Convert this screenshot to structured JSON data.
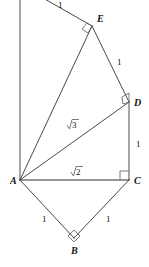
{
  "figure": {
    "background_color": "#ffffff",
    "line_color": "#4a4a4a",
    "label_color": "#111111"
  },
  "vertices": [
    {
      "id": "A",
      "label": "A",
      "x": 20,
      "y": 180,
      "label_x": 10,
      "label_y": 184
    },
    {
      "id": "B",
      "label": "B",
      "x": 74,
      "y": 238,
      "label_x": 71,
      "label_y": 254
    },
    {
      "id": "C",
      "label": "C",
      "x": 129,
      "y": 180,
      "label_x": 134,
      "label_y": 184
    },
    {
      "id": "D",
      "label": "D",
      "x": 129,
      "y": 102,
      "label_x": 134,
      "label_y": 106
    },
    {
      "id": "E",
      "label": "E",
      "x": 92,
      "y": 26,
      "label_x": 97,
      "label_y": 22
    }
  ],
  "segments": [
    {
      "id": "A-B",
      "from": "A",
      "to": "B"
    },
    {
      "id": "B-C",
      "from": "B",
      "to": "C"
    },
    {
      "id": "A-C",
      "from": "A",
      "to": "C"
    },
    {
      "id": "C-D",
      "from": "C",
      "to": "D"
    },
    {
      "id": "A-D",
      "from": "A",
      "to": "D"
    },
    {
      "id": "D-E",
      "from": "D",
      "to": "E"
    },
    {
      "id": "A-E",
      "from": "A",
      "to": "E"
    },
    {
      "id": "E-top",
      "from": "E",
      "to": "top-edge"
    },
    {
      "id": "A-vert",
      "from": "A",
      "to": "top-edge-vertical"
    }
  ],
  "edge_labels": [
    {
      "id": "label-AB",
      "text": "1",
      "x": 42,
      "y": 222,
      "segment": "A-B"
    },
    {
      "id": "label-BC",
      "text": "1",
      "x": 106,
      "y": 222,
      "segment": "B-C"
    },
    {
      "id": "label-CD",
      "text": "1",
      "x": 136,
      "y": 147,
      "segment": "C-D"
    },
    {
      "id": "label-DE",
      "text": "1",
      "x": 117,
      "y": 65,
      "segment": "D-E"
    },
    {
      "id": "label-Etop",
      "text": "1",
      "x": 58,
      "y": 8,
      "segment": "E-top"
    },
    {
      "id": "label-AC",
      "text": "2",
      "x": 76,
      "y": 174,
      "segment": "A-C",
      "radical": true
    },
    {
      "id": "label-AD",
      "text": "3",
      "x": 72,
      "y": 127,
      "segment": "A-D",
      "radical": true
    }
  ],
  "right_angles": [
    {
      "id": "right-angle-B",
      "at": "B",
      "style": "diamond"
    },
    {
      "id": "right-angle-C",
      "at": "C",
      "style": "square"
    },
    {
      "id": "right-angle-D",
      "at": "D",
      "style": "square"
    },
    {
      "id": "right-angle-E",
      "at": "E",
      "style": "square"
    }
  ]
}
